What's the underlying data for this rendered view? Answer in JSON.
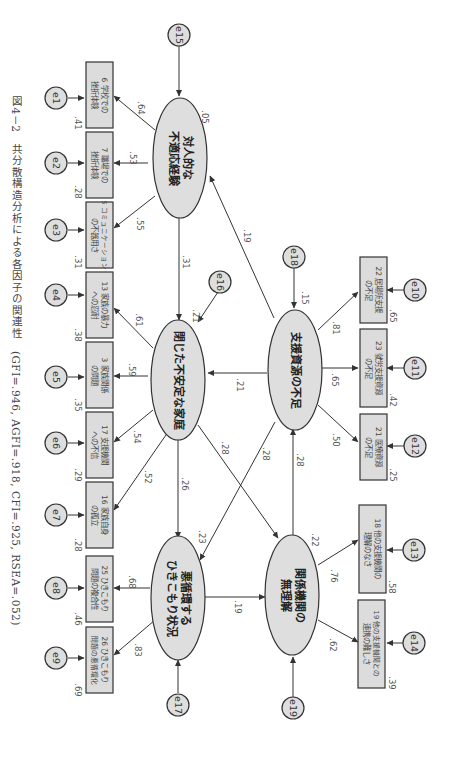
{
  "caption": {
    "figure_no": "図4－2",
    "title": "共分散構造分析による各因子の関連性",
    "fit": "(GFI=.946, AGFI=.918, CFI=.925, RSEA=.052)"
  },
  "latent": {
    "interpersonal": {
      "label1": "対人的な",
      "label2": "不適応経験",
      "r2": ".05",
      "error": "e15"
    },
    "family": {
      "label1": "閉じた不安定な家庭",
      "label2": "",
      "r2": ".21",
      "error": "e16"
    },
    "hikikomori": {
      "label1": "悪循環する",
      "label2": "ひきこもり状況",
      "r2": ".23",
      "error": "e17"
    },
    "resources": {
      "label1": "支援資源の不足",
      "label2": "",
      "r2": ".15",
      "error": "e18"
    },
    "agencies": {
      "label1": "関係機関の",
      "label2": "無理解",
      "r2": ".22",
      "error": "e19"
    }
  },
  "indicators": [
    {
      "line1": "6 学校での",
      "line2": "挫折体験",
      "loading": ".64",
      "r2": ".41",
      "error": "e1"
    },
    {
      "line1": "7 職場での",
      "line2": "挫折体験",
      "loading": ".53",
      "r2": ".28",
      "error": "e2"
    },
    {
      "line1": "5 コミュニケーション",
      "line2": "の不器用さ",
      "loading": ".55",
      "r2": ".31",
      "error": "e3"
    },
    {
      "line1": "13 家族の暴力",
      "line2": "への忍耐",
      "loading": ".61",
      "r2": ".38",
      "error": "e4"
    },
    {
      "line1": "3 家族関係",
      "line2": "の問題",
      "loading": ".59",
      "r2": ".35",
      "error": "e5"
    },
    {
      "line1": "17 支援機関",
      "line2": "への不信",
      "loading": ".54",
      "r2": ".29",
      "error": "e6"
    },
    {
      "line1": "16 家族自身",
      "line2": "の孤立",
      "loading": ".52",
      "r2": ".28",
      "error": "e7"
    },
    {
      "line1": "25 ひきこもり",
      "line2": "問題の複合性",
      "loading": ".68",
      "r2": ".46",
      "error": "e8"
    },
    {
      "line1": "26 ひきこもり",
      "line2": "問題の悪循環化",
      "loading": ".83",
      "r2": ".69",
      "error": "e9"
    },
    {
      "line1": "22 居場所支援",
      "line2": "の不足",
      "loading": ".81",
      "r2": ".65",
      "error": "e10"
    },
    {
      "line1": "23 就労支援資源",
      "line2": "の不足",
      "loading": ".65",
      "r2": ".42",
      "error": "e11"
    },
    {
      "line1": "21 医療資源",
      "line2": "の不足",
      "loading": ".50",
      "r2": ".25",
      "error": "e12"
    },
    {
      "line1": "18 他の支援機関の",
      "line2": "理解のなさ",
      "loading": ".76",
      "r2": ".58",
      "error": "e13"
    },
    {
      "line1": "19 他の支援機関との",
      "line2": "連携の難しさ",
      "loading": ".62",
      "r2": ".39",
      "error": "e14"
    }
  ],
  "paths": {
    "interpersonal_to_family": ".31",
    "resources_to_interpersonal": ".19",
    "resources_to_family": ".21",
    "family_to_hikikomori": ".26",
    "family_to_agencies": ".28",
    "resources_to_hikikomori": ".28",
    "agencies_to_resources": ".28",
    "hikikomori_to_agencies": ".19"
  }
}
